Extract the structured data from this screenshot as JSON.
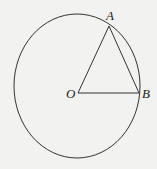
{
  "diagram": {
    "type": "geometry",
    "background": "#f2f2f0",
    "stroke_color": "#333333",
    "points": {
      "A": {
        "label": "A",
        "x": 109,
        "y": 26
      },
      "O": {
        "label": "O",
        "x": 78,
        "y": 93
      },
      "B": {
        "label": "B",
        "x": 139,
        "y": 93
      }
    },
    "circle": {
      "cx": 77,
      "cy": 86,
      "rx": 63,
      "ry": 72
    },
    "segments": [
      [
        "O",
        "A"
      ],
      [
        "A",
        "B"
      ],
      [
        "O",
        "B"
      ]
    ]
  }
}
